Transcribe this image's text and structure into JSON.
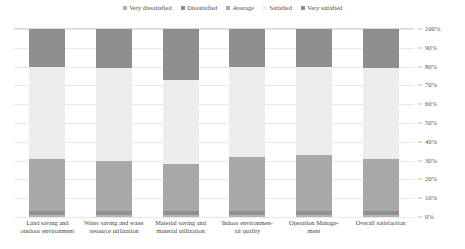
{
  "chart_data": {
    "type": "bar",
    "subtype": "100% stacked bar",
    "title": "",
    "xlabel": "",
    "ylabel": "",
    "ylim": [
      0,
      100
    ],
    "grid": true,
    "legend_position": "top-center",
    "y_tick_labels": [
      "100%",
      "90%",
      "80%",
      "70%",
      "60%",
      "50%",
      "40%",
      "30%",
      "20%",
      "10%",
      "0%"
    ],
    "y_tick_values": [
      100,
      90,
      80,
      70,
      60,
      50,
      40,
      30,
      20,
      10,
      0
    ],
    "categories": [
      "Land saving and outdoor environment",
      "Water saving and water resource utilization",
      "Material saving and material utilization",
      "Indoor environmental quality",
      "Operation Management",
      "Overall satisfaction"
    ],
    "category_lines": [
      [
        "Land saving and",
        "outdoor environment"
      ],
      [
        "Water saving and water",
        "resource utilization"
      ],
      [
        "Material saving and",
        "material utilization"
      ],
      [
        "Indoor environmen-",
        "tal quality"
      ],
      [
        "Operation Manage-",
        "ment"
      ],
      [
        "Overall satisfaction"
      ]
    ],
    "series": [
      {
        "name": "Very dissatisfied",
        "color": "#b4b4b4",
        "values": [
          1,
          1,
          1,
          1,
          1,
          1
        ]
      },
      {
        "name": "Dissatisfied",
        "color": "#909090",
        "values": [
          2,
          2,
          2,
          2,
          2,
          2
        ]
      },
      {
        "name": "Average",
        "color": "#a8a8a8",
        "values": [
          28,
          27,
          25,
          29,
          30,
          28
        ]
      },
      {
        "name": "Satisfied",
        "color": "#ededed",
        "values": [
          49,
          49,
          45,
          48,
          47,
          48
        ]
      },
      {
        "name": "Very satisfied",
        "color": "#8f8f8f",
        "values": [
          20,
          21,
          27,
          20,
          20,
          21
        ]
      }
    ]
  },
  "legend": {
    "items": [
      {
        "label": "Very dissatisfied",
        "color": "#b4b4b4"
      },
      {
        "label": "Dissatisfied",
        "color": "#909090"
      },
      {
        "label": "Average",
        "color": "#a8a8a8"
      },
      {
        "label": "Satisfied",
        "color": "#ededed"
      },
      {
        "label": "Very satisfied",
        "color": "#8f8f8f"
      }
    ]
  },
  "colors": {
    "background": "#ffffff",
    "gridline": "#e8e8e8",
    "axis": "#bfbfbf",
    "text": "#3f3f3f"
  }
}
